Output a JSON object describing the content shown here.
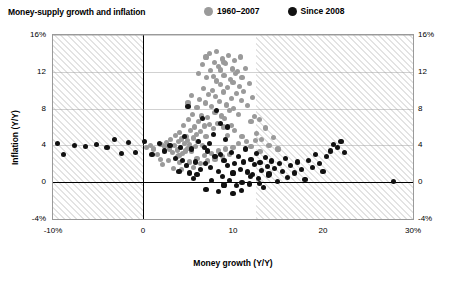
{
  "header": {
    "title": "Money-supply growth and inflation"
  },
  "legend": {
    "items": [
      {
        "label": "1960–2007",
        "color": "#9a9a9a"
      },
      {
        "label": "Since 2008",
        "color": "#111111"
      }
    ]
  },
  "chart_data": {
    "type": "scatter",
    "title": "Money-supply growth and inflation",
    "xlabel": "Money growth (Y/Y)",
    "ylabel": "Inflation (Y/Y)",
    "xlim": [
      -10,
      30
    ],
    "ylim": [
      -4,
      16
    ],
    "xticks": [
      "-10%",
      "0",
      "10",
      "20",
      "30%"
    ],
    "xtick_values": [
      -10,
      0,
      10,
      20,
      30
    ],
    "yticks": [
      "16%",
      "12",
      "8",
      "4",
      "0",
      "-4%"
    ],
    "ytick_values": [
      16,
      12,
      8,
      4,
      0,
      -4
    ],
    "yticks_right": [
      "16%",
      "12",
      "8",
      "4",
      "0",
      "-4%"
    ],
    "grid": false,
    "legend_position": "top",
    "series": [
      {
        "name": "1960–2007",
        "color": "#9a9a9a",
        "points": [
          [
            2.0,
            4.1
          ],
          [
            2.4,
            3.9
          ],
          [
            2.6,
            4.3
          ],
          [
            2.9,
            3.6
          ],
          [
            3.1,
            4.6
          ],
          [
            3.3,
            3.2
          ],
          [
            3.5,
            4.0
          ],
          [
            3.6,
            5.1
          ],
          [
            3.8,
            3.5
          ],
          [
            3.9,
            4.4
          ],
          [
            4.0,
            2.9
          ],
          [
            4.1,
            5.4
          ],
          [
            4.2,
            3.8
          ],
          [
            4.3,
            4.7
          ],
          [
            4.4,
            3.1
          ],
          [
            4.5,
            6.2
          ],
          [
            4.6,
            4.2
          ],
          [
            4.7,
            3.4
          ],
          [
            4.8,
            5.0
          ],
          [
            4.9,
            4.5
          ],
          [
            5.0,
            3.7
          ],
          [
            5.1,
            6.8
          ],
          [
            5.2,
            4.1
          ],
          [
            5.3,
            5.6
          ],
          [
            5.4,
            3.3
          ],
          [
            5.5,
            7.4
          ],
          [
            5.6,
            4.8
          ],
          [
            5.7,
            6.0
          ],
          [
            5.8,
            3.9
          ],
          [
            5.9,
            5.2
          ],
          [
            6.0,
            8.1
          ],
          [
            6.1,
            4.4
          ],
          [
            6.2,
            6.6
          ],
          [
            6.3,
            9.0
          ],
          [
            6.4,
            5.5
          ],
          [
            6.5,
            7.2
          ],
          [
            6.6,
            4.0
          ],
          [
            6.7,
            10.2
          ],
          [
            6.8,
            6.1
          ],
          [
            6.9,
            8.6
          ],
          [
            7.0,
            5.0
          ],
          [
            7.1,
            11.4
          ],
          [
            7.2,
            7.0
          ],
          [
            7.3,
            9.5
          ],
          [
            7.4,
            6.3
          ],
          [
            7.5,
            12.1
          ],
          [
            7.6,
            8.2
          ],
          [
            7.7,
            10.0
          ],
          [
            7.8,
            5.8
          ],
          [
            7.9,
            13.0
          ],
          [
            8.0,
            7.6
          ],
          [
            8.1,
            9.3
          ],
          [
            8.2,
            11.0
          ],
          [
            8.3,
            6.4
          ],
          [
            8.4,
            12.6
          ],
          [
            8.5,
            8.8
          ],
          [
            8.6,
            10.6
          ],
          [
            8.7,
            7.2
          ],
          [
            8.8,
            13.4
          ],
          [
            8.9,
            9.8
          ],
          [
            9.0,
            11.6
          ],
          [
            9.1,
            6.9
          ],
          [
            9.2,
            12.9
          ],
          [
            9.3,
            8.4
          ],
          [
            9.4,
            10.3
          ],
          [
            9.5,
            13.8
          ],
          [
            9.6,
            7.8
          ],
          [
            9.7,
            11.2
          ],
          [
            9.8,
            9.1
          ],
          [
            9.9,
            12.3
          ],
          [
            10.0,
            10.8
          ],
          [
            10.1,
            8.0
          ],
          [
            10.2,
            13.2
          ],
          [
            10.3,
            11.8
          ],
          [
            10.4,
            9.6
          ],
          [
            10.5,
            12.0
          ],
          [
            10.6,
            7.4
          ],
          [
            10.7,
            10.4
          ],
          [
            10.8,
            13.6
          ],
          [
            10.9,
            8.9
          ],
          [
            11.0,
            11.4
          ],
          [
            11.2,
            9.9
          ],
          [
            11.4,
            12.4
          ],
          [
            11.6,
            8.3
          ],
          [
            11.8,
            10.7
          ],
          [
            12.0,
            6.6
          ],
          [
            12.2,
            9.2
          ],
          [
            12.4,
            7.1
          ],
          [
            12.6,
            5.3
          ],
          [
            12.9,
            6.8
          ],
          [
            13.2,
            4.6
          ],
          [
            13.6,
            5.9
          ],
          [
            14.0,
            4.0
          ],
          [
            14.5,
            4.9
          ],
          [
            15.0,
            3.6
          ],
          [
            4.3,
            1.4
          ],
          [
            4.8,
            1.8
          ],
          [
            5.2,
            2.2
          ],
          [
            5.6,
            1.6
          ],
          [
            6.0,
            2.6
          ],
          [
            6.4,
            2.0
          ],
          [
            6.8,
            2.9
          ],
          [
            7.2,
            2.3
          ],
          [
            7.6,
            3.1
          ],
          [
            8.0,
            2.5
          ],
          [
            8.4,
            3.4
          ],
          [
            8.8,
            2.8
          ],
          [
            9.2,
            3.6
          ],
          [
            9.6,
            3.0
          ],
          [
            10.0,
            3.8
          ],
          [
            2.2,
            1.9
          ],
          [
            2.8,
            2.4
          ],
          [
            3.4,
            1.5
          ],
          [
            3.8,
            2.8
          ],
          [
            4.1,
            2.1
          ],
          [
            1.6,
            3.0
          ],
          [
            1.9,
            2.5
          ],
          [
            1.2,
            3.6
          ],
          [
            0.8,
            4.0
          ],
          [
            0.4,
            3.8
          ],
          [
            5.0,
            8.6
          ],
          [
            5.4,
            9.4
          ],
          [
            6.2,
            11.8
          ],
          [
            6.6,
            12.8
          ],
          [
            7.0,
            13.6
          ],
          [
            7.4,
            14.0
          ],
          [
            7.8,
            11.5
          ],
          [
            8.2,
            14.2
          ],
          [
            8.6,
            12.2
          ],
          [
            9.0,
            13.0
          ],
          [
            11.0,
            5.0
          ],
          [
            11.5,
            4.4
          ],
          [
            12.0,
            3.9
          ],
          [
            12.5,
            4.5
          ],
          [
            13.0,
            3.3
          ],
          [
            10.6,
            4.2
          ],
          [
            10.2,
            5.6
          ],
          [
            9.8,
            6.2
          ],
          [
            9.4,
            5.1
          ],
          [
            8.9,
            6.0
          ]
        ]
      },
      {
        "name": "Since 2008",
        "color": "#111111",
        "points": [
          [
            -9.5,
            4.2
          ],
          [
            -8.8,
            3.0
          ],
          [
            -7.6,
            4.0
          ],
          [
            -6.4,
            3.9
          ],
          [
            -5.2,
            4.1
          ],
          [
            -4.0,
            3.8
          ],
          [
            -3.2,
            4.6
          ],
          [
            -2.4,
            3.1
          ],
          [
            -1.6,
            4.3
          ],
          [
            -0.8,
            3.2
          ],
          [
            0.2,
            4.4
          ],
          [
            1.0,
            3.0
          ],
          [
            1.8,
            4.2
          ],
          [
            2.4,
            3.4
          ],
          [
            3.0,
            4.0
          ],
          [
            3.6,
            2.6
          ],
          [
            4.2,
            3.8
          ],
          [
            4.6,
            5.0
          ],
          [
            5.0,
            8.2
          ],
          [
            5.4,
            3.6
          ],
          [
            5.8,
            2.2
          ],
          [
            6.2,
            4.4
          ],
          [
            6.6,
            6.9
          ],
          [
            6.9,
            2.0
          ],
          [
            7.2,
            3.4
          ],
          [
            7.5,
            1.6
          ],
          [
            7.8,
            5.2
          ],
          [
            8.0,
            2.8
          ],
          [
            8.2,
            7.8
          ],
          [
            8.4,
            1.2
          ],
          [
            8.6,
            3.0
          ],
          [
            8.8,
            0.6
          ],
          [
            9.0,
            2.4
          ],
          [
            9.2,
            4.6
          ],
          [
            9.4,
            1.8
          ],
          [
            9.6,
            0.2
          ],
          [
            9.8,
            3.2
          ],
          [
            10.0,
            1.0
          ],
          [
            10.2,
            2.0
          ],
          [
            10.4,
            -0.4
          ],
          [
            10.6,
            2.8
          ],
          [
            10.8,
            1.4
          ],
          [
            11.0,
            0.0
          ],
          [
            11.2,
            2.2
          ],
          [
            11.4,
            3.6
          ],
          [
            11.6,
            1.1
          ],
          [
            11.8,
            -0.2
          ],
          [
            12.0,
            2.5
          ],
          [
            12.2,
            0.8
          ],
          [
            12.4,
            1.9
          ],
          [
            12.6,
            3.1
          ],
          [
            12.8,
            0.4
          ],
          [
            13.0,
            2.1
          ],
          [
            13.2,
            1.3
          ],
          [
            13.4,
            -0.6
          ],
          [
            13.6,
            2.7
          ],
          [
            13.8,
            1.7
          ],
          [
            14.0,
            0.9
          ],
          [
            14.3,
            2.3
          ],
          [
            14.6,
            1.5
          ],
          [
            14.9,
            0.1
          ],
          [
            15.2,
            2.0
          ],
          [
            15.5,
            1.2
          ],
          [
            15.8,
            2.6
          ],
          [
            16.1,
            0.5
          ],
          [
            16.4,
            1.8
          ],
          [
            16.8,
            1.0
          ],
          [
            17.2,
            2.2
          ],
          [
            17.6,
            1.4
          ],
          [
            18.0,
            0.3
          ],
          [
            18.4,
            2.4
          ],
          [
            18.8,
            1.6
          ],
          [
            19.2,
            3.0
          ],
          [
            19.6,
            2.0
          ],
          [
            20.0,
            1.2
          ],
          [
            20.4,
            2.8
          ],
          [
            20.8,
            3.4
          ],
          [
            21.2,
            4.1
          ],
          [
            21.6,
            3.8
          ],
          [
            22.0,
            4.4
          ],
          [
            22.4,
            3.2
          ],
          [
            27.8,
            0.1
          ],
          [
            6.0,
            0.8
          ],
          [
            7.0,
            -0.8
          ],
          [
            7.6,
            0.2
          ],
          [
            8.4,
            -1.0
          ],
          [
            9.0,
            -0.3
          ],
          [
            10.0,
            -1.2
          ],
          [
            10.9,
            -0.9
          ],
          [
            11.9,
            0.6
          ],
          [
            12.9,
            -0.1
          ],
          [
            13.9,
            0.7
          ],
          [
            5.2,
            1.0
          ],
          [
            5.6,
            0.4
          ],
          [
            4.8,
            1.8
          ],
          [
            4.4,
            2.4
          ],
          [
            4.0,
            1.2
          ],
          [
            6.4,
            1.4
          ],
          [
            6.8,
            3.8
          ],
          [
            7.4,
            4.2
          ],
          [
            8.6,
            6.4
          ],
          [
            9.4,
            6.0
          ]
        ]
      }
    ]
  },
  "axes": {
    "x_title": "Money growth (Y/Y)",
    "y_title": "Inflation (Y/Y)"
  }
}
